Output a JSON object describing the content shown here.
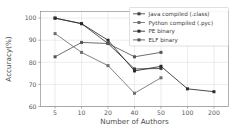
{
  "chart_data": {
    "type": "line",
    "title": "",
    "xlabel": "Number of Authors",
    "ylabel": "Accuracy(%)",
    "x": [
      5,
      10,
      20,
      40,
      50,
      100,
      200
    ],
    "xtick_labels": [
      "5",
      "10",
      "20",
      "40",
      "50",
      "100",
      "200"
    ],
    "ytick_labels": [
      "60",
      "70",
      "80",
      "90",
      "100"
    ],
    "yticks": [
      60,
      70,
      80,
      90,
      100
    ],
    "ylim": [
      60,
      103
    ],
    "grid": true,
    "legend_position": "upper right",
    "series": [
      {
        "name": "Java compiled (.class)",
        "color": "#3f3f3f",
        "marker": "square",
        "x": [
          5,
          10,
          20,
          40,
          50
        ],
        "values": [
          100.0,
          97.5,
          88.5,
          77.0,
          77.2
        ]
      },
      {
        "name": "Python compiled (.pyc)",
        "color": "#6e6e6e",
        "marker": "square",
        "x": [
          5,
          10,
          20,
          40,
          50
        ],
        "values": [
          93.0,
          84.5,
          78.5,
          66.0,
          73.0
        ]
      },
      {
        "name": "PE binary",
        "color": "#2b2b2b",
        "marker": "square",
        "x": [
          5,
          10,
          20,
          40,
          50,
          100,
          200
        ],
        "values": [
          100.0,
          97.5,
          90.0,
          76.1,
          78.2,
          68.0,
          66.7
        ]
      },
      {
        "name": "ELF binary",
        "color": "#555555",
        "marker": "square",
        "x": [
          5,
          10,
          20,
          40,
          50
        ],
        "values": [
          82.5,
          89.0,
          88.5,
          82.5,
          84.5
        ]
      }
    ]
  },
  "axes": {
    "ylabel": "Accuracy(%)",
    "xlabel": "Number of Authors"
  },
  "legend": {
    "entries": [
      {
        "label": "Java compiled (.class)"
      },
      {
        "label": "Python compiled (.pyc)"
      },
      {
        "label": "PE binary"
      },
      {
        "label": "ELF binary"
      }
    ]
  }
}
